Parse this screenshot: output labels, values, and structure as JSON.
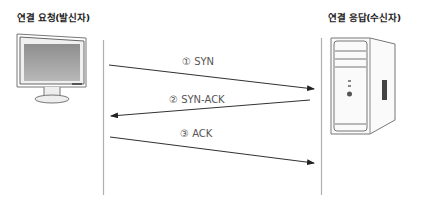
{
  "sender": {
    "label": "연결 요청(발신자)",
    "icon": "monitor-icon"
  },
  "receiver": {
    "label": "연결 응답(수신자)",
    "icon": "desktop-tower-icon"
  },
  "messages": [
    {
      "step": "①",
      "label": "① SYN",
      "direction": "sender-to-receiver"
    },
    {
      "step": "②",
      "label": "② SYN-ACK",
      "direction": "receiver-to-sender"
    },
    {
      "step": "③",
      "label": "③ ACK",
      "direction": "sender-to-receiver"
    }
  ],
  "colors": {
    "line": "#333333",
    "lifeline": "#b0b0b0",
    "text": "#555555"
  }
}
